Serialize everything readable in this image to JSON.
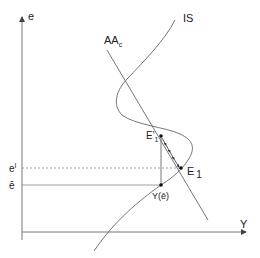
{
  "diagram": {
    "axes": {
      "y_label": "e",
      "x_label": "Y"
    },
    "curves": {
      "is_label": "IS",
      "aa_label_main": "AA",
      "aa_label_sub": "c"
    },
    "points": {
      "e1_prime_main": "E'",
      "e1_prime_sub": "1",
      "e1_main": "E",
      "e1_sub": "1",
      "y_ebar": "Y(ē)"
    },
    "levels": {
      "e_prime_main": "e",
      "e_prime_sup": "I",
      "e_bar": "ē"
    },
    "colors": {
      "line": "#555555",
      "axis": "#777777",
      "text": "#222222"
    }
  }
}
